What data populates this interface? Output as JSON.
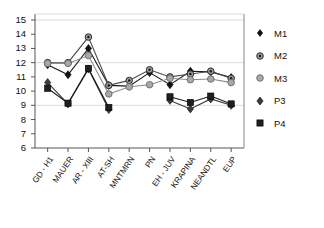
{
  "chart_data": {
    "type": "line",
    "title": "",
    "xlabel": "",
    "ylabel": "",
    "ylim": [
      6,
      15
    ],
    "yticks": [
      6,
      7,
      8,
      9,
      10,
      11,
      12,
      13,
      14,
      15
    ],
    "gridlines": [
      9,
      12,
      15
    ],
    "grid": true,
    "legend_position": "right",
    "categories": [
      "GD - H1",
      "MAUER",
      "AR - XIII",
      "AT-SH",
      "MNTMRN",
      "PN",
      "EH - JUV",
      "KRAPINA",
      "NEANDTL",
      "EUP"
    ],
    "series": [
      {
        "name": "M1",
        "marker": "diamond",
        "color": "#1a1a1a",
        "values": [
          11.85,
          11.15,
          13.0,
          10.4,
          10.35,
          11.3,
          10.45,
          11.4,
          11.35,
          10.95
        ]
      },
      {
        "name": "M2",
        "marker": "circle-dot",
        "color": "#4a4a4a",
        "values": [
          12.0,
          12.0,
          13.8,
          10.4,
          10.75,
          11.5,
          11.0,
          11.2,
          11.4,
          10.9
        ]
      },
      {
        "name": "M3",
        "marker": "circle",
        "color": "#8c8c8c",
        "values": [
          11.95,
          11.95,
          12.5,
          9.8,
          10.3,
          10.45,
          10.9,
          10.8,
          10.85,
          10.6
        ]
      },
      {
        "name": "P3",
        "marker": "diamond-gray",
        "color": "#3a3a3a",
        "values": [
          10.6,
          9.1,
          11.55,
          8.7,
          null,
          null,
          9.35,
          8.75,
          9.45,
          9.0
        ]
      },
      {
        "name": "P4",
        "marker": "square",
        "color": "#1a1a1a",
        "values": [
          10.2,
          9.15,
          11.6,
          8.85,
          null,
          null,
          9.6,
          9.2,
          9.65,
          9.1
        ]
      }
    ]
  },
  "legend": {
    "items": [
      {
        "label": "M1"
      },
      {
        "label": "M2"
      },
      {
        "label": "M3"
      },
      {
        "label": "P3"
      },
      {
        "label": "P4"
      }
    ]
  }
}
